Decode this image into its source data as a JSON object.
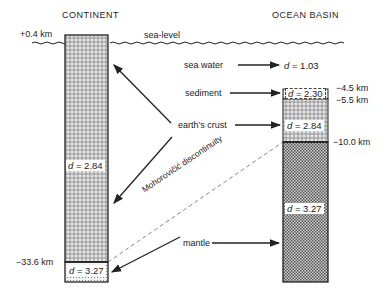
{
  "columns": {
    "continent": {
      "title": "CONTINENT"
    },
    "ocean": {
      "title": "OCEAN BASIN"
    }
  },
  "sea_level_label": "sea-level",
  "depths": {
    "continent_top": "+0.4 km",
    "continent_moho": "−33.6 km",
    "ocean_sediment_top": "−4.5 km",
    "ocean_crust_top": "−5.5 km",
    "ocean_moho": "−10.0 km"
  },
  "densities": {
    "sea_water": "= 1.03",
    "sediment": "= 2.30",
    "ocean_crust": "= 2.84",
    "ocean_mantle": "= 3.27",
    "continent_crust": "= 2.84",
    "continent_mantle": "= 3.27",
    "symbol": "d"
  },
  "labels": {
    "sea_water": "sea water",
    "sediment": "sediment",
    "earths_crust": "earth’s crust",
    "mantle": "mantle",
    "moho": "Mohorovičić discontinuity"
  },
  "colors": {
    "line": "#222222",
    "background": "#ffffff"
  }
}
